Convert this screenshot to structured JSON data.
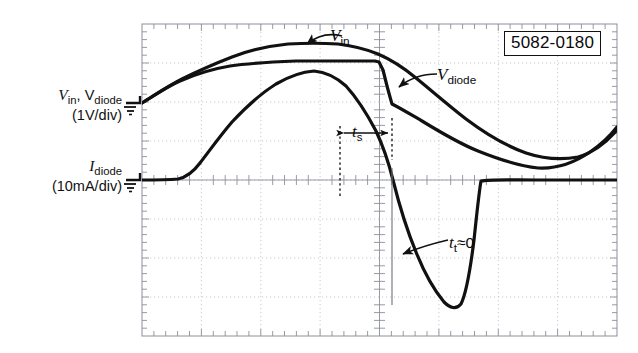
{
  "figure": {
    "kind": "oscilloscope-screenshot",
    "device_part_number": "5082-0180",
    "background_color": "#ffffff",
    "trace_color": "#111111",
    "grid_color": "#b9bcc4"
  },
  "axes": {
    "voltage": {
      "label_line1": "V<sub>in</sub>, V<sub>diode</sub>",
      "label_line2": "(1V/div)",
      "scale": "1V/div",
      "ground_marker": "ground-symbol"
    },
    "current": {
      "label_line1": "I<sub>diode</sub>",
      "label_line2": "(10mA/div)",
      "scale": "10mA/div",
      "ground_marker": "ground-symbol"
    }
  },
  "annotations": {
    "vin": "V<sub>in</sub>",
    "vdiode": "V<sub>diode</sub>",
    "ts": "t<sub>s</sub>",
    "tt": "t<sub>t</sub>≈0",
    "part_number": "5082-0180"
  },
  "chart_data": {
    "type": "line",
    "title": "",
    "xlabel": "",
    "ylabel": "",
    "grid": true,
    "legend_position": "inline-annotations",
    "plot_box_px": {
      "x": 142,
      "y": 24,
      "width": 475,
      "height": 312
    },
    "divisions": {
      "horizontal": 8,
      "vertical": 8
    },
    "axis_ranges": {
      "x_div": 8,
      "y_div": 8
    },
    "ground_levels_px": {
      "voltage_ground_y": 103,
      "current_ground_y": 180
    },
    "markers": {
      "ts_start_px_x": 340,
      "ts_end_px_x": 392,
      "trigger_px_x": 380,
      "reverse_recovery_px_x": 392
    },
    "series": [
      {
        "name": "V_in",
        "style": "thick-solid",
        "points_px": [
          [
            142,
            103
          ],
          [
            160,
            92
          ],
          [
            180,
            80
          ],
          [
            200,
            70
          ],
          [
            220,
            62
          ],
          [
            240,
            55
          ],
          [
            260,
            50
          ],
          [
            280,
            46
          ],
          [
            300,
            44
          ],
          [
            318,
            43
          ],
          [
            336,
            44
          ],
          [
            355,
            47
          ],
          [
            372,
            52
          ],
          [
            392,
            60
          ],
          [
            410,
            70
          ],
          [
            430,
            83
          ],
          [
            450,
            96
          ],
          [
            470,
            110
          ],
          [
            490,
            124
          ],
          [
            510,
            137
          ],
          [
            530,
            147
          ],
          [
            550,
            155
          ],
          [
            566,
            158
          ],
          [
            580,
            157
          ],
          [
            595,
            150
          ],
          [
            605,
            140
          ],
          [
            617,
            125
          ]
        ]
      },
      {
        "name": "V_diode",
        "style": "thick-solid",
        "points_px": [
          [
            142,
            103
          ],
          [
            160,
            92
          ],
          [
            180,
            81
          ],
          [
            200,
            73
          ],
          [
            220,
            68
          ],
          [
            240,
            65
          ],
          [
            260,
            63
          ],
          [
            280,
            62
          ],
          [
            300,
            61
          ],
          [
            320,
            61
          ],
          [
            340,
            61
          ],
          [
            360,
            61
          ],
          [
            375,
            61
          ],
          [
            381,
            62
          ],
          [
            385,
            72
          ],
          [
            388,
            86
          ],
          [
            390,
            96
          ],
          [
            392,
            103
          ],
          [
            405,
            110
          ],
          [
            420,
            119
          ],
          [
            440,
            131
          ],
          [
            460,
            142
          ],
          [
            480,
            152
          ],
          [
            500,
            160
          ],
          [
            520,
            166
          ],
          [
            540,
            168
          ],
          [
            558,
            167
          ],
          [
            575,
            161
          ],
          [
            590,
            152
          ],
          [
            605,
            140
          ],
          [
            617,
            126
          ]
        ]
      },
      {
        "name": "I_diode",
        "style": "thick-solid",
        "points_px": [
          [
            142,
            180
          ],
          [
            160,
            180
          ],
          [
            175,
            179
          ],
          [
            186,
            176
          ],
          [
            196,
            168
          ],
          [
            208,
            155
          ],
          [
            220,
            140
          ],
          [
            232,
            124
          ],
          [
            244,
            110
          ],
          [
            256,
            98
          ],
          [
            268,
            88
          ],
          [
            280,
            80
          ],
          [
            292,
            75
          ],
          [
            304,
            72
          ],
          [
            314,
            71
          ],
          [
            326,
            73
          ],
          [
            338,
            79
          ],
          [
            348,
            88
          ],
          [
            358,
            100
          ],
          [
            368,
            116
          ],
          [
            376,
            132
          ],
          [
            384,
            152
          ],
          [
            390,
            172
          ],
          [
            396,
            196
          ],
          [
            404,
            220
          ],
          [
            414,
            248
          ],
          [
            424,
            272
          ],
          [
            432,
            288
          ],
          [
            440,
            300
          ],
          [
            446,
            307
          ],
          [
            452,
            309
          ],
          [
            458,
            306
          ],
          [
            463,
            296
          ],
          [
            468,
            274
          ],
          [
            472,
            248
          ],
          [
            476,
            215
          ],
          [
            479,
            190
          ],
          [
            482,
            180
          ],
          [
            490,
            179
          ],
          [
            510,
            180
          ],
          [
            540,
            180
          ],
          [
            570,
            180
          ],
          [
            600,
            180
          ],
          [
            617,
            180
          ]
        ]
      }
    ]
  }
}
